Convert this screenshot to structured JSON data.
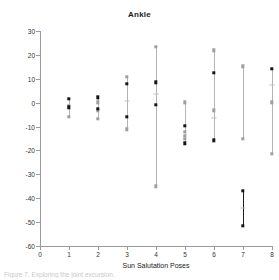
{
  "figure": {
    "title": "Ankle",
    "caption": "Figure 7. Exploring the joint excursion."
  },
  "chart_data": {
    "type": "scatter",
    "title": "Ankle",
    "xlabel": "Sun Salutation Poses",
    "ylabel": "Degrees",
    "xlim": [
      0,
      8
    ],
    "ylim": [
      -60,
      30
    ],
    "yticks": [
      30,
      20,
      10,
      0,
      -10,
      -20,
      -30,
      -40,
      -50,
      -60
    ],
    "xticks": [
      0,
      1,
      2,
      3,
      4,
      5,
      6,
      7,
      8
    ],
    "grid": false,
    "legend": "none",
    "categories": [
      "1",
      "2",
      "3",
      "4",
      "5",
      "6",
      "7",
      "8"
    ],
    "series": [
      {
        "name": "dark",
        "color": "#141414",
        "points": [
          {
            "x": 1,
            "high": 1.5,
            "mid": -2.0,
            "low": -2.0
          },
          {
            "x": 2,
            "high": 2.2,
            "mid": -2.5,
            "low": -2.5
          },
          {
            "x": 3,
            "high": 7.8,
            "mid": -5.8,
            "low": -5.8
          },
          {
            "x": 4,
            "high": 8.6,
            "mid": -0.8,
            "low": -0.8
          },
          {
            "x": 5,
            "high": -9.6,
            "mid": -17.0,
            "low": -17.0
          },
          {
            "x": 6,
            "high": 12.5,
            "mid": -15.7,
            "low": -15.7
          },
          {
            "x": 7,
            "high": -37.0,
            "mid": -51.5,
            "low": -51.5
          },
          {
            "x": 8,
            "high": 14.3,
            "mid": 14.3,
            "low": 14.3
          }
        ]
      },
      {
        "name": "light",
        "color": "#a8a8a8",
        "points": [
          {
            "x": 1,
            "high": 1.5,
            "mid": -1.2,
            "low": -6.0
          },
          {
            "x": 2,
            "high": 2.2,
            "mid": -1.5,
            "low": -6.8
          },
          {
            "x": 3,
            "high": 10.8,
            "mid": 0.8,
            "low": -11.2
          },
          {
            "x": 4,
            "high": 23.5,
            "mid": 3.6,
            "low": -35.0
          },
          {
            "x": 5,
            "high": 0.2,
            "mid": -11.8,
            "low": -17.0
          },
          {
            "x": 6,
            "high": 22.0,
            "mid": -3.2,
            "low": -15.7
          },
          {
            "x": 7,
            "high": 15.3,
            "mid": 0.0,
            "low": -15.0
          },
          {
            "x": 8,
            "high": 14.3,
            "mid": 7.2,
            "low": -21.5
          }
        ]
      }
    ],
    "markers": {
      "1": {
        "dark": [
          1.5,
          -2.0
        ],
        "light": [
          -1.2,
          -6.0
        ],
        "ticks": []
      },
      "2": {
        "dark": [
          2.2,
          -2.5
        ],
        "light": [
          0.2,
          -3.5,
          -6.8
        ],
        "ticks": []
      },
      "3": {
        "dark": [
          7.8,
          -5.8
        ],
        "light": [
          10.8,
          -11.2
        ],
        "ticks": [
          0.8
        ]
      },
      "4": {
        "dark": [
          8.6,
          -0.8
        ],
        "light": [
          23.5,
          -35.0
        ],
        "ticks": [
          3.6
        ]
      },
      "5": {
        "dark": [
          -9.6,
          -17.0
        ],
        "light": [
          0.2,
          -12.2,
          -13.8,
          -15.2
        ],
        "ticks": []
      },
      "6": {
        "dark": [
          12.5,
          -15.7
        ],
        "light": [
          22.0,
          -3.2
        ],
        "ticks": [
          -6.5
        ]
      },
      "7": {
        "dark": [
          -37.0,
          -51.5
        ],
        "light": [
          15.3,
          -15.0
        ],
        "ticks": [
          -44.0
        ]
      },
      "8": {
        "dark": [
          14.3
        ],
        "light": [
          0.2,
          -21.5
        ],
        "ticks": [
          7.2
        ]
      }
    }
  }
}
